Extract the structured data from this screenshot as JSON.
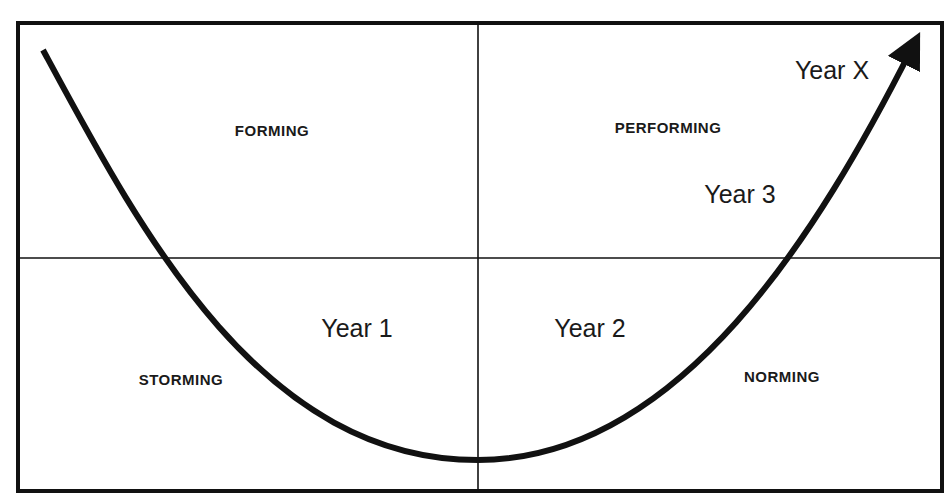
{
  "diagram": {
    "type": "team-development-curve",
    "colors": {
      "line": "#111111",
      "background": "#ffffff",
      "text": "#1a1a1a"
    },
    "quadrants": {
      "top_left": {
        "label": "FORMING"
      },
      "top_right": {
        "label": "PERFORMING"
      },
      "bottom_left": {
        "label": "STORMING"
      },
      "bottom_right": {
        "label": "NORMING"
      }
    },
    "milestones": [
      {
        "label": "Year 1"
      },
      {
        "label": "Year 2"
      },
      {
        "label": "Year 3"
      },
      {
        "label": "Year X"
      }
    ]
  }
}
